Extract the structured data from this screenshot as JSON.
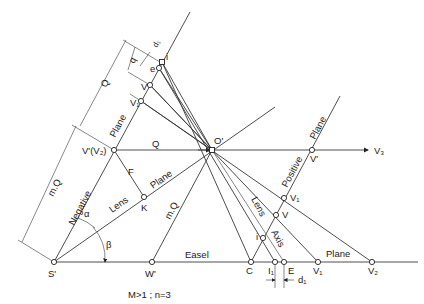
{
  "diagram": {
    "caption": "M>1 ; n=3",
    "points": {
      "S_prime": "S'",
      "W_prime": "W'",
      "O_prime": "O'",
      "V_prime_V2": "V'(V₂)",
      "V_prime_right": "V'",
      "V3": "V₃",
      "K": "K",
      "F": "F",
      "C": "C",
      "I1": "I₁",
      "E": "E",
      "V1_bottom": "V₁",
      "V2_bottom": "V₂",
      "i_top": "i",
      "e_top": "e",
      "V_top": "V",
      "V1_top": "V₁",
      "V1_right": "V₁",
      "V_right": "V",
      "i_right": "i"
    },
    "line_labels": {
      "easel": "Easel",
      "easel_plane": "Plane",
      "negative": "Negative",
      "negative_plane": "Plane",
      "lens": "Lens",
      "lens_plane": "Plane",
      "positive": "Positive",
      "positive_plane": "Plane",
      "lens_axis_lens": "Lens",
      "lens_axis_axis": "Axis"
    },
    "dimensions": {
      "Q_left": "Q",
      "mQ_left": "m.Q",
      "Q_horizontal": "Q",
      "mQ_diag": "m.Q",
      "q": "q",
      "d1_top": "d₁",
      "d1_bottom": "d₁"
    },
    "angles": {
      "alpha": "α",
      "beta": "β"
    }
  }
}
